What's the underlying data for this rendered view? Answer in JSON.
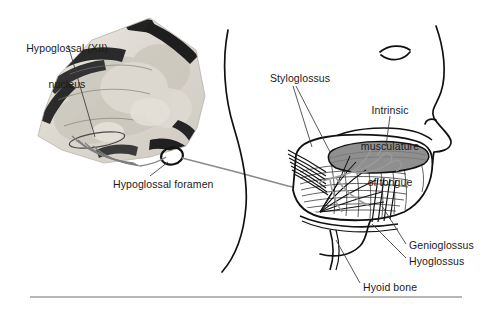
{
  "figure": {
    "background_color": "#ffffff",
    "text_color": "#1a1a1a",
    "nerve_color": "#8a8a8a",
    "outline_color": "#111111",
    "tongue_dorsum_color": "#8f8f8f",
    "rule": {
      "color": "#6e6e6e",
      "x1": 30,
      "x2": 462,
      "y": 297
    }
  },
  "labels": {
    "nucleus": "Hypoglossal (XII)\nnucleus",
    "nucleus_line1": "Hypoglossal (XII)",
    "nucleus_line2": "nucleus",
    "foramen": "Hypoglossal foramen",
    "styloglossus": "Styloglossus",
    "intrinsic": "Intrinsic\nmusculature\nof tongue",
    "intrinsic_line1": "Intrinsic",
    "intrinsic_line2": "musculature",
    "intrinsic_line3": "of tongue",
    "genioglossus": "Genioglossus",
    "hyoglossus": "Hyoglossus",
    "hyoid_bone": "Hyoid bone"
  },
  "structures": {
    "brainstem_section": "photomicrograph-of-medulla-cross-section",
    "nucleus_outline": "elongated-oval-outline",
    "rootlets_count": 4,
    "foramen_ring": "oval-ring",
    "head_profile": "lateral-head-outline-with-eye-and-nose",
    "tongue": "sagittal-tongue-with-muscle-striations",
    "nerve_branches_into_tongue": 3
  }
}
